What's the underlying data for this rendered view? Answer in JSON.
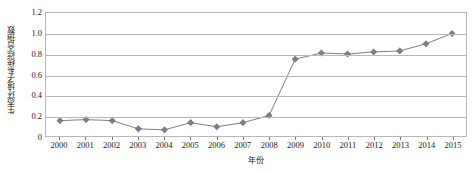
{
  "chart_data": {
    "type": "line",
    "title": "",
    "xlabel": "年份",
    "ylabel": "生态环境子系统综合指数",
    "categories": [
      "2000",
      "2001",
      "2002",
      "2003",
      "2004",
      "2005",
      "2006",
      "2007",
      "2008",
      "2009",
      "2010",
      "2011",
      "2012",
      "2013",
      "2014",
      "2015"
    ],
    "values": [
      0.15,
      0.16,
      0.15,
      0.07,
      0.06,
      0.13,
      0.09,
      0.13,
      0.2,
      0.75,
      0.81,
      0.8,
      0.82,
      0.83,
      0.9,
      1.0
    ],
    "ylim": [
      0,
      1.2
    ],
    "yticks": [
      "0",
      "0.2",
      "0.4",
      "0.6",
      "0.8",
      "1.0",
      "1.2"
    ],
    "ytick_values": [
      0,
      0.2,
      0.4,
      0.6,
      0.8,
      1.0,
      1.2
    ],
    "grid": true,
    "legend": "none",
    "series_color": "#808080",
    "marker": "diamond",
    "marker_color": "#808080",
    "grid_color": "#b8b8b8"
  }
}
